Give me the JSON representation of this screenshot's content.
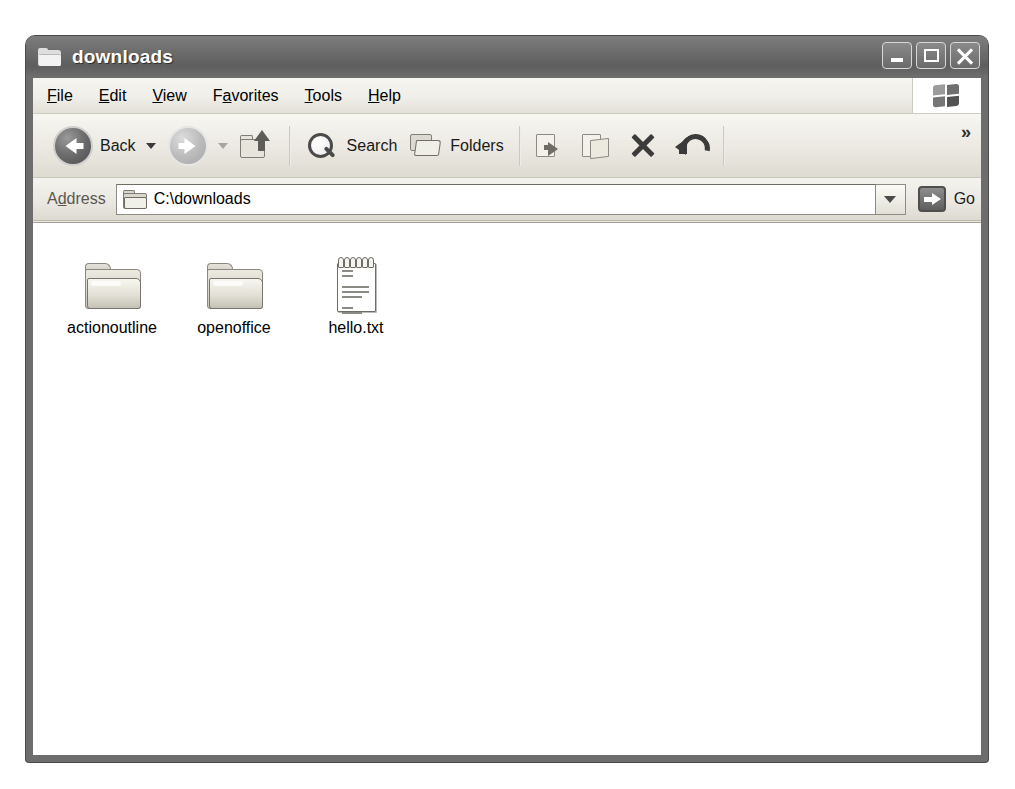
{
  "window": {
    "title": "downloads",
    "title_icon": "folder-icon",
    "controls": {
      "minimize": "minimize-button",
      "maximize": "maximize-button",
      "close": "close-button"
    }
  },
  "menu": {
    "items": [
      {
        "label": "File",
        "accel": "F",
        "pre": "",
        "post": "ile"
      },
      {
        "label": "Edit",
        "accel": "E",
        "pre": "",
        "post": "dit"
      },
      {
        "label": "View",
        "accel": "V",
        "pre": "",
        "post": "iew"
      },
      {
        "label": "Favorites",
        "accel": "a",
        "pre": "F",
        "post": "vorites"
      },
      {
        "label": "Tools",
        "accel": "T",
        "pre": "",
        "post": "ools"
      },
      {
        "label": "Help",
        "accel": "H",
        "pre": "",
        "post": "elp"
      }
    ],
    "brand_icon": "windows-flag-icon"
  },
  "toolbar": {
    "back_label": "Back",
    "forward_label": "",
    "search_label": "Search",
    "folders_label": "Folders",
    "overflow_label": "»",
    "icons": [
      "back-arrow-icon",
      "forward-arrow-icon",
      "up-folder-icon",
      "search-icon",
      "folders-icon",
      "move-to-icon",
      "copy-to-icon",
      "delete-icon",
      "undo-icon"
    ]
  },
  "address": {
    "label": "Address",
    "label_pre": "A",
    "label_accel": "d",
    "label_post": "dress",
    "value": "C:\\downloads",
    "placeholder": "C:\\downloads",
    "go_label": "Go",
    "dropdown_icon": "chevron-down-icon"
  },
  "files": [
    {
      "name": "actionoutline",
      "type": "folder"
    },
    {
      "name": "openoffice",
      "type": "folder"
    },
    {
      "name": "hello.txt",
      "type": "text-file"
    }
  ],
  "colors": {
    "titlebar": "#6b6b6b",
    "chrome": "#ece9d8",
    "content": "#ffffff",
    "text": "#000000",
    "page_background": "#ffffff"
  }
}
